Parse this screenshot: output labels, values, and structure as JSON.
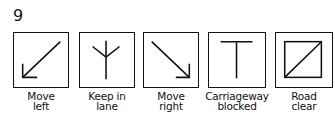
{
  "figure_number": "9",
  "signs": [
    {
      "id": "move-left",
      "icon": "arrow-down-left-icon",
      "line1": "Move",
      "line2": "left"
    },
    {
      "id": "keep-in-lane",
      "icon": "y-fork-icon",
      "line1": "Keep in",
      "line2": "lane"
    },
    {
      "id": "move-right",
      "icon": "arrow-down-right-icon",
      "line1": "Move",
      "line2": "right"
    },
    {
      "id": "carriageway-blocked",
      "icon": "t-bar-icon",
      "line1": "Carriageway",
      "line2": "blocked"
    },
    {
      "id": "road-clear",
      "icon": "diagonal-square-icon",
      "line1": "Road",
      "line2": "clear"
    }
  ],
  "colors": {
    "stroke": "#111111",
    "background": "#ffffff"
  }
}
